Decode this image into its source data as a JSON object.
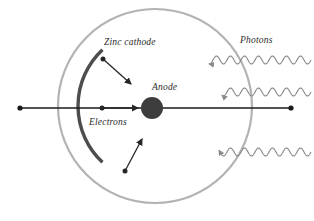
{
  "figure": {
    "background_color": "#ffffff"
  },
  "labels": {
    "zinc_cathode": "Zinc cathode",
    "anode": "Anode",
    "electrons": "Electrons",
    "photons": "Photons"
  },
  "colors": {
    "tube_outline": "#b3b3b3",
    "cathode": "#4d4d4d",
    "anode_fill": "#3d3d3d",
    "wire": "#1a1a1a",
    "photon_wave": "#8c8c8c",
    "electron_arrow": "#262626",
    "text": "#2b2b2b"
  },
  "geometry": {
    "vacuum_tube": {
      "cx": 155,
      "cy": 106,
      "r": 97,
      "stroke_width": 2.2
    },
    "anode": {
      "cx": 152,
      "cy": 108,
      "r": 11
    },
    "cathode_arc": {
      "cx": 155,
      "cy": 106,
      "r": 77,
      "start_angle_deg": 133,
      "end_angle_deg": 227,
      "stroke_width": 3.4
    },
    "wire": {
      "x1": 20,
      "y1": 108,
      "x2": 291,
      "y2": 108,
      "stroke_width": 1.3
    },
    "terminal_left": {
      "cx": 20,
      "cy": 108,
      "r": 2.6
    },
    "terminal_right": {
      "cx": 291,
      "cy": 108,
      "r": 2.6
    }
  },
  "electrons": [
    {
      "name": "electron-upper",
      "dot_x": 103,
      "dot_y": 59,
      "tip_x": 131,
      "tip_y": 84
    },
    {
      "name": "electron-center",
      "dot_x": 102,
      "dot_y": 108,
      "tip_x": 138,
      "tip_y": 108
    },
    {
      "name": "electron-lower",
      "dot_x": 125,
      "dot_y": 171,
      "tip_x": 142,
      "tip_y": 139
    }
  ],
  "photons": [
    {
      "name": "photon-upper",
      "y": 60,
      "x_start": 311,
      "x_end": 209,
      "amplitude": 4.0,
      "wavelength": 14
    },
    {
      "name": "photon-middle",
      "y": 92,
      "x_start": 311,
      "x_end": 222,
      "amplitude": 4.0,
      "wavelength": 14
    },
    {
      "name": "photon-lower",
      "y": 152,
      "x_start": 311,
      "x_end": 219,
      "amplitude": 4.0,
      "wavelength": 14
    }
  ]
}
